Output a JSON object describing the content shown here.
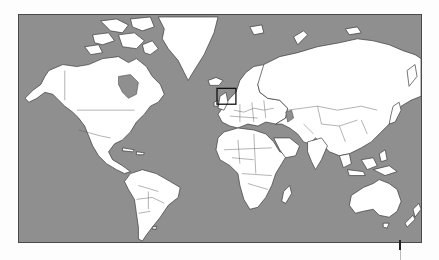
{
  "map": {
    "projection": "Mercator",
    "ocean_color": "#8f8f8f",
    "land_color": "#ffffff",
    "border_color": "#3a3a3a",
    "highlight": {
      "region": "United Kingdom / North Sea",
      "color": "#111111"
    }
  }
}
